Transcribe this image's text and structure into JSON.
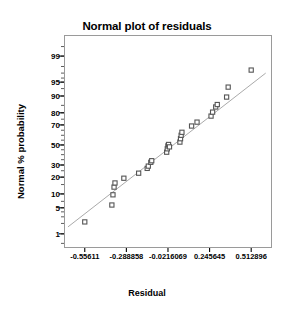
{
  "chart_data": {
    "type": "scatter",
    "title": "Normal plot of residuals",
    "xlabel": "Residual",
    "ylabel": "Normal % probability",
    "grid": false,
    "legend": "none",
    "xlim": [
      -0.689486,
      0.646521
    ],
    "xticks": [
      "-0.55611",
      "-0.288858",
      "-0.0216069",
      "0.245645",
      "0.512896"
    ],
    "xtick_values": [
      -0.55611,
      -0.288858,
      -0.0216069,
      0.245645,
      0.512896
    ],
    "yscale": "normal-probability",
    "ylim": [
      0.35,
      99.8
    ],
    "yticks": [
      "99",
      "95",
      "90",
      "80",
      "70",
      "50",
      "30",
      "20",
      "10",
      "5",
      "1"
    ],
    "ytick_values": [
      99,
      95,
      90,
      80,
      70,
      50,
      30,
      20,
      10,
      5,
      1
    ],
    "marker": "open-square",
    "marker_color": "#555555",
    "line_color": "#aaaaaa",
    "reference_line": {
      "x0": -0.664,
      "y0": 1.6,
      "x1": 0.606,
      "y1": 97.0
    },
    "points": [
      {
        "x": -0.55611,
        "p": 2.2
      },
      {
        "x": -0.382,
        "p": 5.8
      },
      {
        "x": -0.375,
        "p": 9.6
      },
      {
        "x": -0.368,
        "p": 13.5
      },
      {
        "x": -0.362,
        "p": 16.0
      },
      {
        "x": -0.305,
        "p": 19.2
      },
      {
        "x": -0.21,
        "p": 23.0
      },
      {
        "x": -0.155,
        "p": 27.0
      },
      {
        "x": -0.148,
        "p": 29.0
      },
      {
        "x": -0.132,
        "p": 32.5
      },
      {
        "x": -0.126,
        "p": 34.0
      },
      {
        "x": -0.03,
        "p": 42.5
      },
      {
        "x": -0.026,
        "p": 46.0
      },
      {
        "x": -0.022,
        "p": 49.0
      },
      {
        "x": -0.018,
        "p": 50.5
      },
      {
        "x": -0.012,
        "p": 48.0
      },
      {
        "x": 0.055,
        "p": 53.0
      },
      {
        "x": 0.059,
        "p": 56.5
      },
      {
        "x": 0.063,
        "p": 60.0
      },
      {
        "x": 0.068,
        "p": 63.0
      },
      {
        "x": 0.13,
        "p": 69.0
      },
      {
        "x": 0.165,
        "p": 72.5
      },
      {
        "x": 0.255,
        "p": 77.5
      },
      {
        "x": 0.265,
        "p": 80.5
      },
      {
        "x": 0.285,
        "p": 84.0
      },
      {
        "x": 0.295,
        "p": 85.5
      },
      {
        "x": 0.355,
        "p": 89.5
      },
      {
        "x": 0.365,
        "p": 93.5
      },
      {
        "x": 0.512896,
        "p": 97.5
      }
    ]
  }
}
